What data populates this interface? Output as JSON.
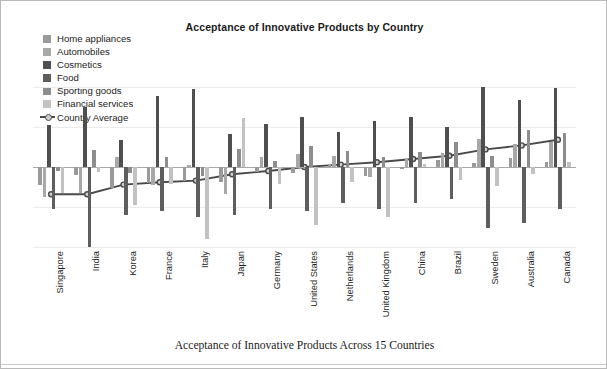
{
  "chart_data": {
    "type": "bar",
    "title": "Acceptance of Innovative Products by Country",
    "caption": "Acceptance of Innovative Products Across 15 Countries",
    "xlabel": "",
    "ylabel": "",
    "ylim": [
      -1.0,
      1.0
    ],
    "grid": true,
    "legend_position": "top-left",
    "categories": [
      "Singapore",
      "India",
      "Korea",
      "France",
      "Italy",
      "Japan",
      "Germany",
      "United States",
      "Netherlands",
      "United Kingdom",
      "China",
      "Brazil",
      "Sweden",
      "Australia",
      "Canada"
    ],
    "series": [
      {
        "name": "Home appliances",
        "color": "#9a9a9a",
        "values": [
          -0.23,
          -0.1,
          -0.26,
          -0.2,
          -0.18,
          -0.19,
          -0.06,
          -0.07,
          0.04,
          -0.11,
          -0.03,
          0.09,
          0.05,
          0.11,
          0.06
        ]
      },
      {
        "name": "Automobiles",
        "color": "#a8a8a8",
        "values": [
          -0.38,
          -0.33,
          0.13,
          -0.23,
          0.03,
          -0.34,
          0.12,
          0.16,
          0.14,
          -0.13,
          0.11,
          0.17,
          0.35,
          0.29,
          0.31
        ]
      },
      {
        "name": "Cosmetics",
        "color": "#4f4f4f",
        "values": [
          0.52,
          0.75,
          0.34,
          0.89,
          0.97,
          0.41,
          0.54,
          0.63,
          0.44,
          0.58,
          0.62,
          0.5,
          1.0,
          0.84,
          0.99
        ]
      },
      {
        "name": "Food",
        "color": "#5e5e5e",
        "values": [
          -0.52,
          -1.0,
          -0.6,
          -0.55,
          -0.63,
          -0.6,
          -0.52,
          -0.55,
          -0.45,
          -0.53,
          -0.45,
          -0.4,
          -0.76,
          -0.7,
          -0.53
        ]
      },
      {
        "name": "Sporting goods",
        "color": "#8d8d8d",
        "values": [
          -0.05,
          0.21,
          -0.07,
          0.13,
          -0.11,
          0.22,
          0.07,
          0.26,
          0.2,
          0.12,
          0.19,
          0.31,
          0.14,
          0.46,
          0.43
        ]
      },
      {
        "name": "Financial services",
        "color": "#c2c2c2",
        "values": [
          -0.33,
          -0.06,
          -0.48,
          -0.21,
          -0.9,
          0.61,
          -0.21,
          -0.73,
          -0.19,
          -0.63,
          0.04,
          -0.16,
          -0.24,
          -0.09,
          0.06
        ]
      }
    ],
    "average_series": {
      "name": "Country Average",
      "color": "#4a4a4a",
      "values": [
        -0.34,
        -0.34,
        -0.22,
        -0.19,
        -0.17,
        -0.09,
        -0.05,
        0.0,
        0.03,
        0.06,
        0.1,
        0.14,
        0.22,
        0.27,
        0.34
      ]
    }
  },
  "legend": {
    "items": [
      {
        "label": "Home appliances",
        "color": "#9a9a9a"
      },
      {
        "label": "Automobiles",
        "color": "#a8a8a8"
      },
      {
        "label": "Cosmetics",
        "color": "#4f4f4f"
      },
      {
        "label": "Food",
        "color": "#5e5e5e"
      },
      {
        "label": "Sporting goods",
        "color": "#8d8d8d"
      },
      {
        "label": "Financial services",
        "color": "#c2c2c2"
      }
    ],
    "average_label": "Country Average"
  }
}
